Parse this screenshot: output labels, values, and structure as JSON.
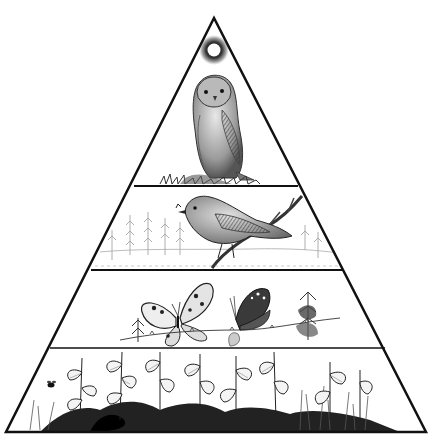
{
  "diagram": {
    "type": "food-pyramid",
    "levels": [
      {
        "index": 0,
        "name": "sun",
        "role": "energy-source"
      },
      {
        "index": 1,
        "name": "owl",
        "role": "tertiary-consumer"
      },
      {
        "index": 2,
        "name": "songbird",
        "role": "secondary-consumer"
      },
      {
        "index": 3,
        "name": "butterflies",
        "role": "primary-consumer"
      },
      {
        "index": 4,
        "name": "nettles-and-plants",
        "role": "producers"
      }
    ]
  },
  "colors": {
    "ink": "#111111",
    "background": "#ffffff",
    "shade": "#555555",
    "light": "#9a9a9a"
  }
}
